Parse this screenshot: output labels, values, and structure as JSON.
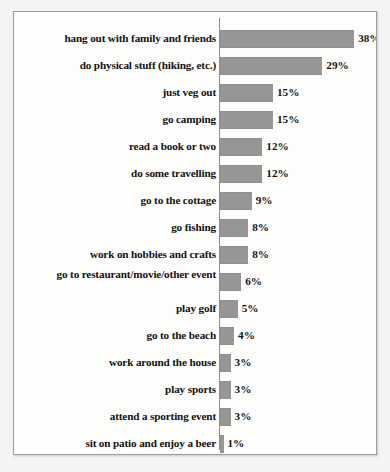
{
  "chart_data": {
    "type": "bar",
    "orientation": "horizontal",
    "title": "",
    "subtitle": "",
    "xlabel": "",
    "ylabel": "",
    "xlim": [
      0,
      40
    ],
    "grid": false,
    "legend": null,
    "value_suffix": "%",
    "bar_color": "#969696",
    "border_color": "#9b9b9b",
    "background_color": "#fdfdfc",
    "categories": [
      "hang out with family and friends",
      "do physical stuff (hiking, etc.)",
      "just veg out",
      "go camping",
      "read a book or two",
      "do some travelling",
      "go to the cottage",
      "go fishing",
      "work on hobbies and crafts",
      "go to restaurant/movie/other event",
      "play golf",
      "go to the beach",
      "work around the house",
      "play sports",
      "attend a sporting event",
      "sit on patio and enjoy a beer"
    ],
    "values": [
      38,
      29,
      15,
      15,
      12,
      12,
      9,
      8,
      8,
      6,
      5,
      4,
      3,
      3,
      3,
      1
    ],
    "value_labels": [
      "38%",
      "29%",
      "15%",
      "15%",
      "12%",
      "12%",
      "9%",
      "8%",
      "8%",
      "6%",
      "5%",
      "4%",
      "3%",
      "3%",
      "3%",
      "1%"
    ]
  }
}
